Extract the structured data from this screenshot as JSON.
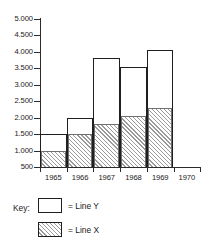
{
  "chart_data": {
    "type": "bar",
    "subtype": "stacked-column",
    "title": "",
    "xlabel": "",
    "ylabel": "",
    "categories": [
      "1965",
      "1966",
      "1967",
      "1968",
      "1969",
      "1970"
    ],
    "series": [
      {
        "name": "Line X",
        "style": "hatched",
        "values": [
          1000,
          1500,
          1800,
          2050,
          2280,
          null
        ]
      },
      {
        "name": "Line Y",
        "style": "white",
        "values": [
          500,
          500,
          2000,
          1500,
          1770,
          null
        ]
      }
    ],
    "totals": [
      1500,
      2000,
      3800,
      3550,
      4050,
      null
    ],
    "ylim": [
      500,
      5000
    ],
    "ytick_values": [
      5000,
      4500,
      4000,
      3500,
      3000,
      2500,
      2000,
      1500,
      1000,
      500
    ],
    "ytick_labels": [
      "5.000",
      "4.500",
      "4.000",
      "3.500",
      "3.000",
      "2.500",
      "2.000",
      "1.500",
      "1.000",
      "500"
    ],
    "xtick_labels": [
      "1965",
      "1966",
      "1967",
      "1968",
      "1969",
      "1970"
    ],
    "grid": false,
    "legend_position": "below",
    "colors": {
      "axis": "#2b2b2b",
      "bar_outline": "#1f1f1f",
      "bar_fill": "#ffffff",
      "hatch": "#9a9a9a",
      "background": "#ffffff"
    }
  },
  "key": {
    "title": "Key:",
    "entries": [
      {
        "swatch": "white-box",
        "label": "= Line Y"
      },
      {
        "swatch": "hatched-box",
        "label": "= Line X"
      }
    ]
  }
}
